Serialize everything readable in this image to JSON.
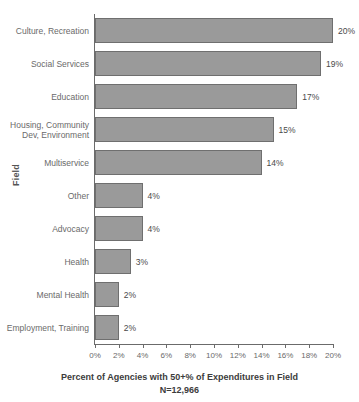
{
  "chart_data": {
    "type": "bar",
    "orientation": "horizontal",
    "title": "",
    "xlabel": "Percent of Agencies with 50+% of Expenditures in Field",
    "sublabel": "N=12,966",
    "ylabel": "Field",
    "xlim": [
      0,
      20
    ],
    "xticks": [
      0,
      2,
      4,
      6,
      8,
      10,
      12,
      14,
      16,
      18,
      20
    ],
    "xtick_labels": [
      "0%",
      "2%",
      "4%",
      "6%",
      "8%",
      "10%",
      "12%",
      "14%",
      "16%",
      "18%",
      "20%"
    ],
    "grid": false,
    "legend": false,
    "categories": [
      "Culture, Recreation",
      "Social Services",
      "Education",
      "Housing, Community\nDev, Environment",
      "Multiservice",
      "Other",
      "Advocacy",
      "Health",
      "Mental Health",
      "Employment, Training"
    ],
    "values": [
      20,
      19,
      17,
      15,
      14,
      4,
      4,
      3,
      2,
      2
    ],
    "value_labels": [
      "20%",
      "19%",
      "17%",
      "15%",
      "14%",
      "4%",
      "4%",
      "3%",
      "2%",
      "2%"
    ],
    "bar_color": "#9a9a9a",
    "bar_border_color": "#6f6f6f",
    "axis_color": "#6b6b6b",
    "text_color": "#6a6a6a"
  }
}
